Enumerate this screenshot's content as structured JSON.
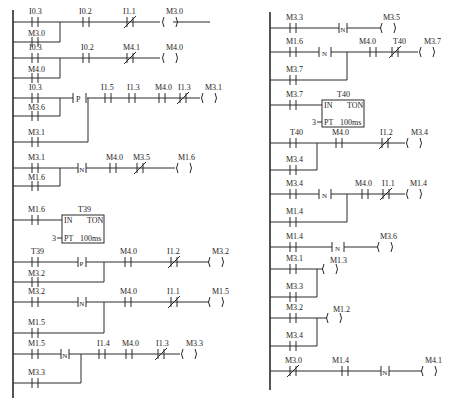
{
  "diagram": {
    "type": "ladder-logic",
    "left_network": {
      "rungs": [
        {
          "inputs": [
            {
              "type": "NO",
              "label": "I0.3"
            }
          ],
          "parallel": [
            {
              "type": "NO",
              "label": "M3.0"
            }
          ],
          "series": [
            {
              "type": "NO",
              "label": "I0.2"
            },
            {
              "type": "NC",
              "label": "I1.1"
            }
          ],
          "coil": "M3.0"
        },
        {
          "inputs": [
            {
              "type": "NO",
              "label": "I0.3"
            }
          ],
          "parallel": [
            {
              "type": "NO",
              "label": "M4.0"
            }
          ],
          "series": [
            {
              "type": "NO",
              "label": "I0.2"
            },
            {
              "type": "NC",
              "label": "M4.1"
            }
          ],
          "coil": "M4.0"
        },
        {
          "inputs": [
            {
              "type": "NO",
              "label": "I0.3"
            }
          ],
          "parallel": [
            {
              "type": "NO",
              "label": "M3.6"
            }
          ],
          "edge": "P",
          "edge_parallel": [
            {
              "type": "NO",
              "label": "M3.1"
            }
          ],
          "series": [
            {
              "type": "NO",
              "label": "I1.5"
            },
            {
              "type": "NO",
              "label": "I1.3"
            },
            {
              "type": "NO",
              "label": "M4.0"
            },
            {
              "type": "NC",
              "label": "I1.3"
            }
          ],
          "coil": "M3.1"
        },
        {
          "inputs": [
            {
              "type": "NO",
              "label": "M3.1"
            }
          ],
          "edge": "N",
          "edge_parallel": [
            {
              "type": "NO",
              "label": "M1.6"
            }
          ],
          "series": [
            {
              "type": "NO",
              "label": "M4.0"
            },
            {
              "type": "NC",
              "label": "M3.5"
            }
          ],
          "coil": "M1.6"
        },
        {
          "inputs": [
            {
              "type": "NO",
              "label": "M1.6"
            }
          ],
          "timer": {
            "name": "T39",
            "type": "TON",
            "in": "IN",
            "pt_label": "PT",
            "pt_value": "3",
            "base": "100ms"
          }
        },
        {
          "inputs": [
            {
              "type": "NO",
              "label": "T39"
            }
          ],
          "edge": "P",
          "edge_parallel": [
            {
              "type": "NO",
              "label": "M3.2"
            }
          ],
          "series": [
            {
              "type": "NO",
              "label": "M4.0"
            },
            {
              "type": "NC",
              "label": "I1.2"
            }
          ],
          "coil": "M3.2"
        },
        {
          "inputs": [
            {
              "type": "NO",
              "label": "M3.2"
            }
          ],
          "edge": "N",
          "edge_parallel": [
            {
              "type": "NO",
              "label": "M1.5"
            }
          ],
          "series": [
            {
              "type": "NO",
              "label": "M4.0"
            },
            {
              "type": "NC",
              "label": "I1.1"
            }
          ],
          "coil": "M1.5"
        },
        {
          "inputs": [
            {
              "type": "NO",
              "label": "M1.5"
            }
          ],
          "edge": "N",
          "edge_parallel": [
            {
              "type": "NO",
              "label": "M3.3"
            }
          ],
          "series": [
            {
              "type": "NO",
              "label": "I1.4"
            },
            {
              "type": "NO",
              "label": "M4.0"
            },
            {
              "type": "NC",
              "label": "I1.3"
            }
          ],
          "coil": "M3.3"
        }
      ]
    },
    "right_network": {
      "rungs": [
        {
          "inputs": [
            {
              "type": "NO",
              "label": "M3.3"
            }
          ],
          "edge": "N",
          "coil": "M3.5"
        },
        {
          "inputs": [
            {
              "type": "NO",
              "label": "M1.6"
            }
          ],
          "edge": "N",
          "edge_parallel": [
            {
              "type": "NO",
              "label": "M3.7"
            }
          ],
          "series": [
            {
              "type": "NO",
              "label": "M4.0"
            },
            {
              "type": "NC",
              "label": "T40"
            }
          ],
          "coil": "M3.7"
        },
        {
          "inputs": [
            {
              "type": "NO",
              "label": "M3.7"
            }
          ],
          "timer": {
            "name": "T40",
            "type": "TON",
            "in": "IN",
            "pt_label": "PT",
            "pt_value": "3",
            "base": "100ms"
          }
        },
        {
          "inputs": [
            {
              "type": "NO",
              "label": "T40"
            }
          ],
          "parallel": [
            {
              "type": "NO",
              "label": "M3.4"
            }
          ],
          "series": [
            {
              "type": "NO",
              "label": "M4.0"
            },
            {
              "type": "NC",
              "label": "I1.2"
            }
          ],
          "coil": "M3.4"
        },
        {
          "inputs": [
            {
              "type": "NO",
              "label": "M3.4"
            }
          ],
          "edge": "N",
          "edge_parallel": [
            {
              "type": "NO",
              "label": "M1.4"
            }
          ],
          "series": [
            {
              "type": "NO",
              "label": "M4.0"
            },
            {
              "type": "NC",
              "label": "I1.1"
            }
          ],
          "coil": "M1.4"
        },
        {
          "inputs": [
            {
              "type": "NO",
              "label": "M1.4"
            }
          ],
          "edge": "N",
          "coil": "M3.6"
        },
        {
          "inputs": [
            {
              "type": "NO",
              "label": "M3.1"
            }
          ],
          "parallel": [
            {
              "type": "NO",
              "label": "M3.3"
            }
          ],
          "coil": "M1.3"
        },
        {
          "inputs": [
            {
              "type": "NO",
              "label": "M3.2"
            }
          ],
          "parallel": [
            {
              "type": "NO",
              "label": "M3.4"
            }
          ],
          "coil": "M1.2"
        },
        {
          "inputs": [
            {
              "type": "NC",
              "label": "M3.0"
            }
          ],
          "series": [
            {
              "type": "NO",
              "label": "M1.4"
            }
          ],
          "edge": "N",
          "coil": "M4.1"
        }
      ]
    }
  },
  "labels": {
    "L": {
      "r1_i03": "I0.3",
      "r1_m30": "M3.0",
      "r1_i02": "I0.2",
      "r1_i11": "I1.1",
      "r1_coil": "M3.0",
      "r2_i03": "I0.3",
      "r2_m40": "M4.0",
      "r2_i02": "I0.2",
      "r2_m41": "M4.1",
      "r2_coil": "M4.0",
      "r3_i03": "I0.3",
      "r3_m36": "M3.6",
      "r3_m31p": "M3.1",
      "r3_p": "P",
      "r3_i15": "I1.5",
      "r3_i13a": "I1.3",
      "r3_m40": "M4.0",
      "r3_i13b": "I1.3",
      "r3_coil": "M3.1",
      "r4_m31": "M3.1",
      "r4_m16p": "M1.6",
      "r4_n": "N",
      "r4_m40": "M4.0",
      "r4_m35": "M3.5",
      "r4_coil": "M1.6",
      "r5_m16": "M1.6",
      "r5_t": "T39",
      "r5_in": "IN",
      "r5_ton": "TON",
      "r5_pt": "PT",
      "r5_ptv": "3",
      "r5_base": "100ms",
      "r6_t39": "T39",
      "r6_m32p": "M3.2",
      "r6_p": "P",
      "r6_m40": "M4.0",
      "r6_i12": "I1.2",
      "r6_coil": "M3.2",
      "r7_m32": "M3.2",
      "r7_m15p": "M1.5",
      "r7_n": "N",
      "r7_m40": "M4.0",
      "r7_i11": "I1.1",
      "r7_coil": "M1.5",
      "r8_m15": "M1.5",
      "r8_m33p": "M3.3",
      "r8_n": "N",
      "r8_i14": "I1.4",
      "r8_m40": "M4.0",
      "r8_i13": "I1.3",
      "r8_coil": "M3.3"
    },
    "R": {
      "r1_m33": "M3.3",
      "r1_n": "N",
      "r1_coil": "M3.5",
      "r2_m16": "M1.6",
      "r2_m37p": "M3.7",
      "r2_n": "N",
      "r2_m40": "M4.0",
      "r2_t40": "T40",
      "r2_coil": "M3.7",
      "r3_m37": "M3.7",
      "r3_t": "T40",
      "r3_in": "IN",
      "r3_ton": "TON",
      "r3_pt": "PT",
      "r3_ptv": "3",
      "r3_base": "100ms",
      "r4_t40": "T40",
      "r4_m34p": "M3.4",
      "r4_m40": "M4.0",
      "r4_i12": "I1.2",
      "r4_coil": "M3.4",
      "r5_m34": "M3.4",
      "r5_m14p": "M1.4",
      "r5_n": "N",
      "r5_m40": "M4.0",
      "r5_i11": "I1.1",
      "r5_coil": "M1.4",
      "r6_m14": "M1.4",
      "r6_n": "N",
      "r6_coil": "M3.6",
      "r7_m31": "M3.1",
      "r7_m33p": "M3.3",
      "r7_coil": "M1.3",
      "r8_m32": "M3.2",
      "r8_m34p": "M3.4",
      "r8_coil": "M1.2",
      "r9_m30": "M3.0",
      "r9_m14": "M1.4",
      "r9_n": "N",
      "r9_coil": "M4.1"
    }
  }
}
